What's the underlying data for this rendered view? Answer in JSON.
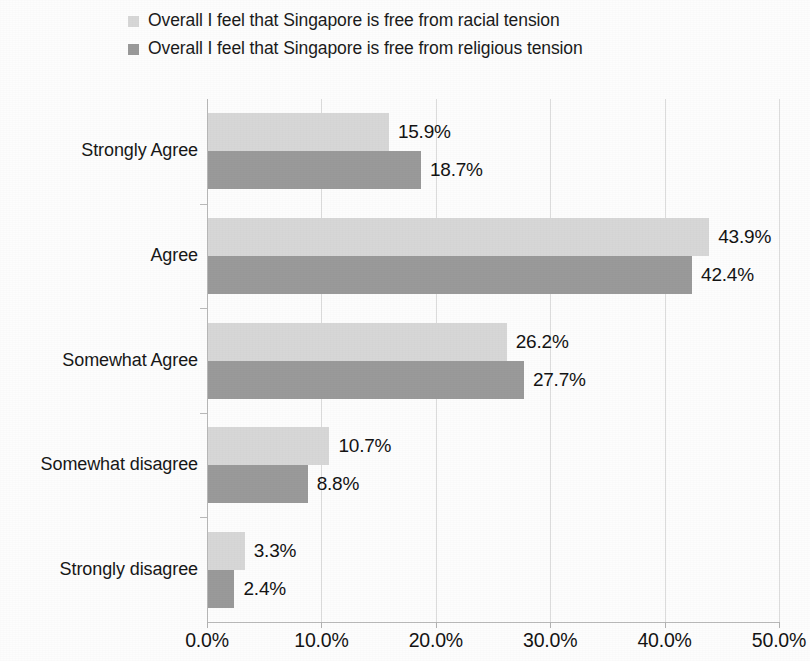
{
  "legend": {
    "items": [
      {
        "label": "Overall I feel that Singapore is free from racial tension",
        "color": "#d7d7d7",
        "icon": "legend-swatch-square"
      },
      {
        "label": "Overall I feel that Singapore is free from religious tension",
        "color": "#9a9a9a",
        "icon": "legend-swatch-square"
      }
    ]
  },
  "axis": {
    "x_ticks": [
      "0.0%",
      "10.0%",
      "20.0%",
      "30.0%",
      "40.0%",
      "50.0%"
    ]
  },
  "chart_data": {
    "type": "bar",
    "orientation": "horizontal",
    "title": "",
    "xlabel": "",
    "ylabel": "",
    "xlim": [
      0,
      50
    ],
    "xtick_values": [
      0,
      10,
      20,
      30,
      40,
      50
    ],
    "xtick_labels": [
      "0.0%",
      "10.0%",
      "20.0%",
      "30.0%",
      "40.0%",
      "50.0%"
    ],
    "grid": "vertical",
    "legend_position": "top-left",
    "categories": [
      "Strongly Agree",
      "Agree",
      "Somewhat Agree",
      "Somewhat disagree",
      "Strongly disagree"
    ],
    "series": [
      {
        "name": "Overall I feel that Singapore is free from racial tension",
        "color": "#d7d7d7",
        "values": [
          15.9,
          43.9,
          26.2,
          10.7,
          3.3
        ],
        "labels": [
          "15.9%",
          "43.9%",
          "26.2%",
          "10.7%",
          "3.3%"
        ]
      },
      {
        "name": "Overall I feel that Singapore is free from religious tension",
        "color": "#9a9a9a",
        "values": [
          18.7,
          42.4,
          27.7,
          8.8,
          2.4
        ],
        "labels": [
          "18.7%",
          "42.4%",
          "27.7%",
          "8.8%",
          "2.4%"
        ]
      }
    ]
  }
}
